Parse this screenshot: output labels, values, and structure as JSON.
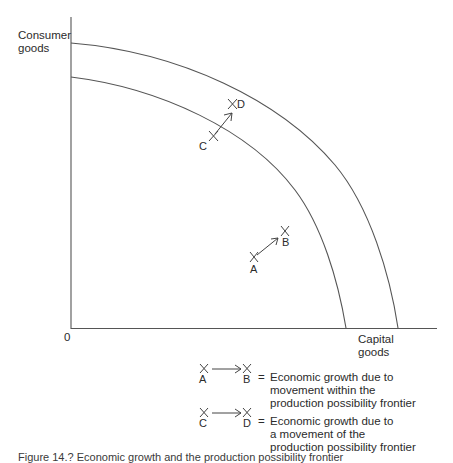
{
  "axes": {
    "y_label_line1": "Consumer",
    "y_label_line2": "goods",
    "x_label_line1": "Capital",
    "x_label_line2": "goods",
    "origin": "0"
  },
  "curves": [
    {
      "name": "original production possibility frontier",
      "y_intercept_px": 77,
      "x_intercept_px": 346
    },
    {
      "name": "shifted production possibility frontier",
      "y_intercept_px": 43,
      "x_intercept_px": 398
    }
  ],
  "points": {
    "A": "A",
    "B": "B",
    "C": "C",
    "D": "D"
  },
  "legend": {
    "items": [
      {
        "from": "A",
        "to": "B",
        "equals": "=",
        "lines": [
          "Economic growth due to",
          "movement within the",
          "production possibility frontier"
        ]
      },
      {
        "from": "C",
        "to": "D",
        "equals": "=",
        "lines": [
          "Economic growth due to",
          "a movement of the",
          "production possibility frontier"
        ]
      }
    ]
  },
  "caption": "Figure 14.? Economic growth and the production possibility frontier",
  "colors": {
    "line": "#4a4a4a",
    "text": "#2b2b2b",
    "background": "#ffffff"
  }
}
